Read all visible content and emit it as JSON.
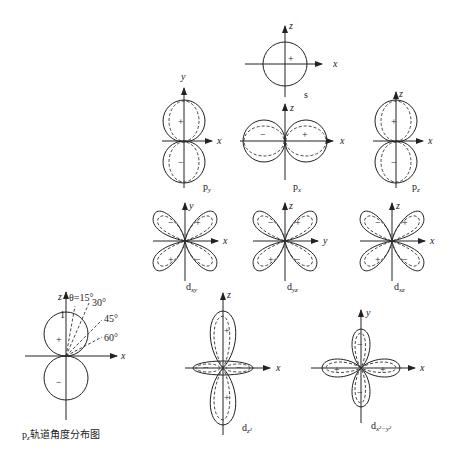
{
  "figure": {
    "orbitals": {
      "s": {
        "name": "s",
        "axes": [
          "x",
          "z"
        ],
        "signs": [
          "+"
        ]
      },
      "py": {
        "name": "p",
        "sub": "y",
        "axes": [
          "x",
          "y"
        ],
        "signs": [
          "+",
          "−"
        ]
      },
      "px": {
        "name": "p",
        "sub": "x",
        "axes": [
          "x",
          "z"
        ],
        "signs": [
          "−",
          "+"
        ]
      },
      "pz": {
        "name": "p",
        "sub": "z",
        "axes": [
          "x",
          "z"
        ],
        "signs": [
          "+",
          "−"
        ]
      },
      "dxy": {
        "name": "d",
        "sub": "xy",
        "axes": [
          "x",
          "y"
        ],
        "signs": [
          "−",
          "+",
          "+",
          "−"
        ]
      },
      "dyz": {
        "name": "d",
        "sub": "yz",
        "axes": [
          "y",
          "z"
        ],
        "signs": [
          "−",
          "+",
          "+",
          "−"
        ]
      },
      "dxz": {
        "name": "d",
        "sub": "xz",
        "axes": [
          "x",
          "z"
        ],
        "signs": [
          "−",
          "+",
          "+",
          "−"
        ]
      },
      "dz2": {
        "name": "d",
        "sub": "z²",
        "axes": [
          "x",
          "z"
        ],
        "signs": [
          "+",
          "+",
          "−",
          "−"
        ]
      },
      "dx2y2": {
        "name": "d",
        "sub": "x²−y²",
        "axes": [
          "x",
          "y"
        ],
        "signs": [
          "−",
          "+",
          "+",
          "−"
        ]
      }
    },
    "angular_plot": {
      "caption_p": "p",
      "caption_sub": "z",
      "caption_text": "轨道角度分布图",
      "axis_z": "z",
      "axis_x": "x",
      "unit_mark": "1",
      "angles": [
        "θ=15°",
        "30°",
        "45°",
        "60°"
      ],
      "signs": [
        "+",
        "−"
      ]
    }
  }
}
